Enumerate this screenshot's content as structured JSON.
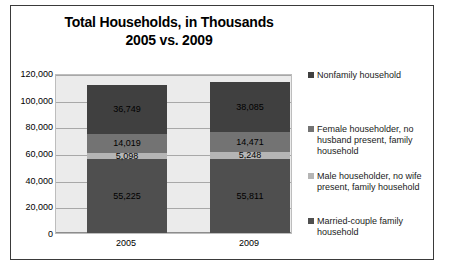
{
  "chart_data": {
    "type": "bar",
    "subtype": "stacked-column",
    "title": "Total Households, in Thousands",
    "subtitle": "2005 vs. 2009",
    "xlabel": "",
    "ylabel": "",
    "categories": [
      "2005",
      "2009"
    ],
    "ylim": [
      0,
      120000
    ],
    "ytick_labels": [
      "120,000",
      "100,000",
      "80,000",
      "60,000",
      "40,000",
      "20,000",
      "0"
    ],
    "ytick_values": [
      120000,
      100000,
      80000,
      60000,
      40000,
      20000,
      0
    ],
    "grid": true,
    "legend_position": "right",
    "series": [
      {
        "name": "Nonfamily household",
        "color": "#404040",
        "values": [
          36749,
          38085
        ],
        "labels": [
          "36,749",
          "38,085"
        ]
      },
      {
        "name": "Female householder, no husband present, family household",
        "color": "#737373",
        "values": [
          14019,
          14471
        ],
        "labels": [
          "14,019",
          "14,471"
        ]
      },
      {
        "name": "Male householder, no wife present, family household",
        "color": "#b5b5b5",
        "values": [
          5098,
          5248
        ],
        "labels": [
          "5,098",
          "5,248"
        ]
      },
      {
        "name": "Married-couple family household",
        "color": "#4f4f4f",
        "values": [
          55225,
          55811
        ],
        "labels": [
          "55,225",
          "55,811"
        ]
      }
    ],
    "stack_totals": [
      111091,
      113615
    ],
    "plot_background": "#ebebeb",
    "gridline_color": "#a8a8a8",
    "border_color": "#3a3a3a"
  }
}
